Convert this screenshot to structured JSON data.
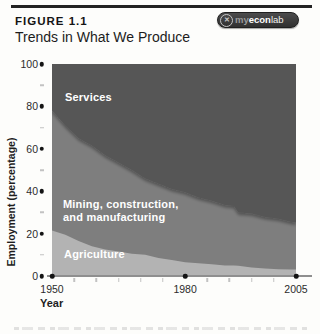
{
  "header": {
    "figure_label": "FIGURE 1.1",
    "title": "Trends in What We Produce"
  },
  "badge": {
    "icon_glyph": "✕",
    "prefix": "my",
    "mid": "econ",
    "suffix": "lab"
  },
  "colors": {
    "services": "#575757",
    "mining": "#7e7e7e",
    "agriculture": "#b3b3b3",
    "top_rule": "#232323",
    "axis_line": "#8f8f8f"
  },
  "chart_data": {
    "type": "area",
    "stacked": true,
    "title": "Trends in What We Produce",
    "xlabel": "Year",
    "ylabel": "Employment (percentage)",
    "xlim": [
      1950,
      2005
    ],
    "ylim": [
      0,
      100
    ],
    "grid": false,
    "legend": "labels-inside-areas",
    "xticks": [
      1950,
      1980,
      2005
    ],
    "yticks": [
      0,
      20,
      40,
      60,
      80,
      100
    ],
    "x_minor_ticks": [
      1955,
      1960,
      1965,
      1970,
      1975,
      1985,
      1990,
      1995,
      2000
    ],
    "y_minor_ticks": [
      10,
      30,
      50,
      70,
      90
    ],
    "x": [
      1950,
      1953,
      1956,
      1959,
      1962,
      1965,
      1968,
      1971,
      1974,
      1977,
      1980,
      1983,
      1986,
      1989,
      1991,
      1992,
      1995,
      1998,
      2001,
      2004,
      2005
    ],
    "series": [
      {
        "name": "Agriculture",
        "color": "#b3b3b3",
        "values": [
          21.5,
          19.5,
          16.5,
          14,
          12.5,
          11.5,
          10.5,
          10,
          8.5,
          7.5,
          6.5,
          6,
          5.5,
          5,
          5,
          4.8,
          4,
          3.5,
          3.2,
          3,
          3
        ]
      },
      {
        "name": "Mining, construction, and manufacturing",
        "color": "#7e7e7e",
        "values": [
          56.5,
          51.5,
          48.5,
          47.5,
          44.5,
          42,
          39.5,
          36,
          35,
          33.5,
          33,
          31,
          30,
          28.5,
          28,
          25.2,
          25.5,
          24.3,
          23.8,
          22.5,
          22.3
        ]
      },
      {
        "name": "Services",
        "color": "#575757",
        "values": [
          22,
          29,
          35,
          38.5,
          43,
          46.5,
          50,
          54,
          56.5,
          59,
          60.5,
          63,
          64.5,
          66.5,
          67,
          70,
          70.5,
          72.2,
          73,
          74.5,
          74.7
        ]
      }
    ],
    "area_labels": {
      "services": "Services",
      "mining_line1": "Mining, construction,",
      "mining_line2": "and manufacturing",
      "agriculture": "Agriculture"
    }
  }
}
